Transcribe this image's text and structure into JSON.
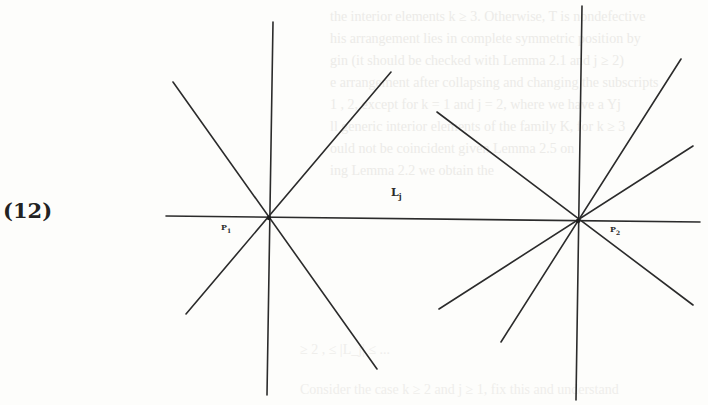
{
  "figure": {
    "equation_number": "(12)",
    "line_label": {
      "base": "L",
      "subscript": "j"
    },
    "points": [
      {
        "id": "p1",
        "base": "P",
        "subscript": "1",
        "center": [
          269,
          218
        ]
      },
      {
        "id": "p2",
        "base": "P",
        "subscript": "2",
        "center": [
          578,
          221
        ]
      }
    ],
    "stroke_color": "#2b2b2b",
    "background_color": "#fdfdfb",
    "lines": {
      "horizontal_lj": [
        166,
        216,
        700,
        222
      ],
      "p1_vertical": [
        273,
        22,
        267,
        395
      ],
      "p1_diag_down": [
        173,
        82,
        377,
        369
      ],
      "p1_diag_up": [
        391,
        72,
        186,
        314
      ],
      "p2_vertical": [
        582,
        6,
        576,
        400
      ],
      "p2_diag_down": [
        437,
        112,
        693,
        305
      ],
      "p2_steep_up": [
        681,
        59,
        501,
        342
      ],
      "p2_shallow_up": [
        693,
        146,
        439,
        309
      ]
    }
  },
  "bleed_through_text": {
    "lines": [
      "the interior elements k ≥ 3. Otherwise, T is nondefective",
      "his arrangement lies in complete symmetric position by",
      "gin (it should be checked with Lemma 2.1 and j ≥ 2)",
      "e arrangement after collapsing and changing the subscripts",
      "1 , 2, except for k = 1 and j = 2, where we have a Yj",
      "ll generic interior elements of the family K, for k ≥ 3",
      "ould not be coincident given Lemma 2.5 on",
      "ing Lemma 2.2 we obtain the"
    ],
    "bottom_lines": [
      "≥ 2 ,    ≤ |L_j| ≤ ...",
      "Consider the case k ≥ 2 and j ≥ 1, fix this and understand"
    ]
  }
}
